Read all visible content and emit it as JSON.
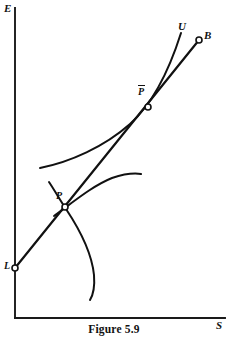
{
  "figure": {
    "caption": "Figure 5.9",
    "axes": {
      "y_axis_label": "E",
      "x_axis_label": "S",
      "origin_x": 15,
      "origin_y": 318,
      "y_axis_top": 8,
      "x_axis_right": 225
    },
    "labels": {
      "utility_curve": "U",
      "budget_endpoint": "B",
      "optimum_point": "P",
      "constrained_point_base": "P",
      "constrained_point_overbar": true,
      "labor_endowment": "L"
    },
    "points": [
      {
        "name": "L",
        "label": "L",
        "x": 15,
        "y": 268
      },
      {
        "name": "P",
        "label": "P",
        "x": 65,
        "y": 207
      },
      {
        "name": "Pbar",
        "label": "P",
        "x": 148,
        "y": 107
      },
      {
        "name": "B",
        "label": "B",
        "x": 199,
        "y": 40
      }
    ],
    "colors": {
      "ink": "#111111",
      "axis": "#1a1a1a",
      "background": "#ffffff",
      "marker_fill": "#ffffff"
    }
  },
  "geometry": {
    "y_axis_path": "M 15 8 L 15 318",
    "x_axis_path": "M 15 318 L 225 318",
    "budget_line_path": "M 15 268 L 199 40",
    "utility_curve_path": "M 40 168 C 70 162, 104 147, 130 124 C 150 106, 168 74, 181 33",
    "lower_curve_path": "M 54 216 C 72 203, 92 186, 112 178 C 124 174, 134 173, 141 174",
    "backbend_curve_path": "M 49 182 C 55 191, 60 200, 66 209 C 80 230, 92 255, 94 275 C 95 288, 93 295, 90 300"
  }
}
